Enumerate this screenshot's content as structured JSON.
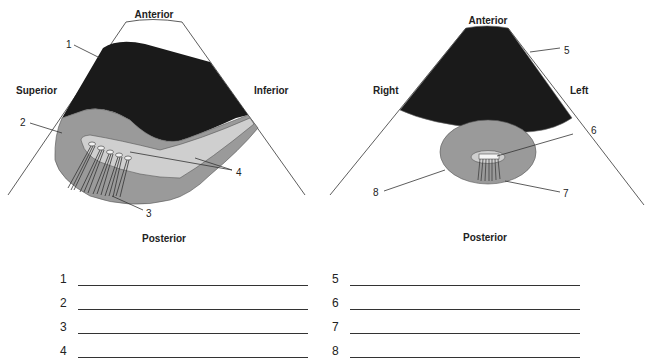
{
  "left_diagram": {
    "orientation": {
      "top": "Anterior",
      "left": "Superior",
      "right": "Inferior",
      "bottom": "Posterior"
    },
    "callouts": [
      "1",
      "2",
      "3",
      "4"
    ]
  },
  "right_diagram": {
    "orientation": {
      "top": "Anterior",
      "left": "Right",
      "right": "Left",
      "bottom": "Posterior"
    },
    "callouts": [
      "5",
      "6",
      "7",
      "8"
    ]
  },
  "answers": {
    "left": [
      {
        "number": "1",
        "value": ""
      },
      {
        "number": "2",
        "value": ""
      },
      {
        "number": "3",
        "value": ""
      },
      {
        "number": "4",
        "value": ""
      }
    ],
    "right": [
      {
        "number": "5",
        "value": ""
      },
      {
        "number": "6",
        "value": ""
      },
      {
        "number": "7",
        "value": ""
      },
      {
        "number": "8",
        "value": ""
      }
    ]
  },
  "colors": {
    "dark_fill": "#1a1a1a",
    "mid_gray": "#9a9a9a",
    "light_gray": "#cfcfcf",
    "line": "#333333"
  }
}
